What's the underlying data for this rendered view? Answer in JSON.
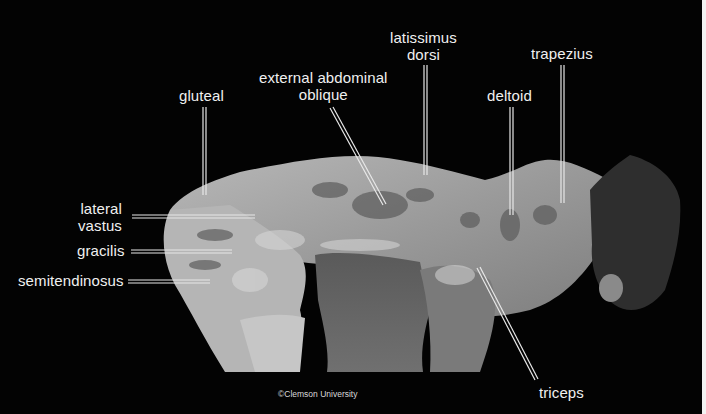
{
  "figure": {
    "background_color": "#030303",
    "label_color": "#f0f0f0",
    "copyright": "©Clemson University"
  },
  "labels": {
    "gluteal": "gluteal",
    "external_abdominal_oblique_1": "external abdominal",
    "external_abdominal_oblique_2": "oblique",
    "latissimus_dorsi_1": "latissimus",
    "latissimus_dorsi_2": "dorsi",
    "deltoid": "deltoid",
    "trapezius": "trapezius",
    "lateral_vastus_1": "lateral",
    "lateral_vastus_2": "vastus",
    "gracilis": "gracilis",
    "semitendinosus": "semitendinosus",
    "triceps": "triceps"
  }
}
